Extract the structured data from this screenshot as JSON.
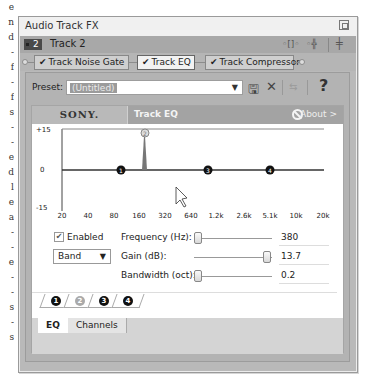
{
  "background_fragments": [
    "e",
    "n",
    "d",
    "-",
    "f",
    "-",
    "f",
    "s",
    "-",
    "-",
    "e",
    "d",
    "l",
    "e",
    "a",
    "-",
    "-",
    "e",
    "-",
    "-",
    "s",
    "-",
    "s"
  ],
  "window": {
    "title": "Audio Track FX",
    "maximize_icon": "restore-icon"
  },
  "track": {
    "number": "2",
    "name": "Track 2",
    "icons": [
      "plugin-chain-icon",
      "plugin-add-icon",
      "mixer-icon"
    ]
  },
  "fx_chain": [
    {
      "label": "Track Noise Gate",
      "checked": true,
      "active": false
    },
    {
      "label": "Track EQ",
      "checked": true,
      "active": true
    },
    {
      "label": "Track Compressor",
      "checked": true,
      "active": false
    }
  ],
  "preset": {
    "label": "Preset:",
    "value": "(Untitled)",
    "toolbar": [
      "save-icon",
      "delete-icon",
      "compare-icon",
      "help-icon"
    ]
  },
  "plugin": {
    "brand": "SONY.",
    "name": "Track EQ",
    "about_label": "About >"
  },
  "graph": {
    "y_labels": [
      "+15",
      "0",
      "-15"
    ],
    "x_labels": [
      "20",
      "40",
      "80",
      "160",
      "320",
      "640",
      "1.2k",
      "2.6k",
      "5.1k",
      "10k",
      "20k"
    ],
    "band_points": [
      {
        "id": "1",
        "freq_label": "~110 Hz",
        "gain": 0
      },
      {
        "id": "2",
        "freq_label": "380 Hz",
        "gain": 13.7
      },
      {
        "id": "3",
        "freq_label": "~1k Hz",
        "gain": 0
      },
      {
        "id": "4",
        "freq_label": "~4.5k Hz",
        "gain": 0
      }
    ]
  },
  "controls": {
    "enabled_label": "Enabled",
    "enabled_checked": true,
    "filter_type": "Band",
    "frequency_label": "Frequency (Hz):",
    "frequency_value": "380",
    "gain_label": "Gain (dB):",
    "gain_value": "13.7",
    "bandwidth_label": "Bandwidth (oct):",
    "bandwidth_value": "0.2"
  },
  "band_tabs": [
    "1",
    "2",
    "3",
    "4"
  ],
  "selected_band": "2",
  "bottom_tabs": [
    {
      "label": "EQ",
      "active": true
    },
    {
      "label": "Channels",
      "active": false
    }
  ],
  "text": {
    "check": "✔",
    "dropdown_arrow": "▼",
    "save_glyph": "🖫",
    "delete_glyph": "✕",
    "compare_glyph": "⇆",
    "help_glyph": "?",
    "icon_chain": "◦[]◦",
    "icon_add": "◦╬",
    "icon_mixer": "╪"
  }
}
